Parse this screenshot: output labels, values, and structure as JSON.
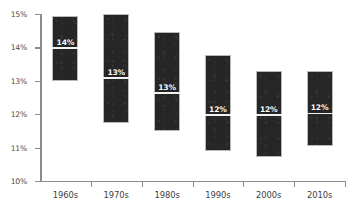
{
  "chart_data": {
    "type": "bar",
    "subtype": "floating-range-bar-with-median",
    "title": "",
    "xlabel": "",
    "ylabel": "",
    "categories": [
      "1960s",
      "1970s",
      "1980s",
      "1990s",
      "2000s",
      "2010s"
    ],
    "ylim": [
      10,
      15
    ],
    "ytick_labels": [
      "10%",
      "11%",
      "12%",
      "13%",
      "14%",
      "15%"
    ],
    "ytick_values": [
      10,
      11,
      12,
      13,
      14,
      15
    ],
    "grid": false,
    "legend": null,
    "value_suffix": "%",
    "series": [
      {
        "name": "Range (low to high)",
        "low": [
          13.0,
          11.75,
          11.5,
          10.9,
          10.72,
          11.05
        ],
        "high": [
          14.93,
          15.0,
          14.45,
          13.77,
          13.3,
          13.3
        ]
      },
      {
        "name": "Median",
        "values": [
          14.0,
          13.1,
          12.65,
          12.0,
          12.0,
          12.05
        ]
      }
    ],
    "bars": [
      {
        "category": "1960s",
        "low": 13.0,
        "high": 14.93,
        "median": 14.0,
        "label": "14%"
      },
      {
        "category": "1970s",
        "low": 11.75,
        "high": 15.0,
        "median": 13.1,
        "label": "13%"
      },
      {
        "category": "1980s",
        "low": 11.5,
        "high": 14.45,
        "median": 12.65,
        "label": "13%"
      },
      {
        "category": "1990s",
        "low": 10.9,
        "high": 13.77,
        "median": 12.0,
        "label": "12%"
      },
      {
        "category": "2000s",
        "low": 10.72,
        "high": 13.3,
        "median": 12.0,
        "label": "12%"
      },
      {
        "category": "2010s",
        "low": 11.05,
        "high": 13.3,
        "median": 12.05,
        "label": "12%"
      }
    ],
    "colors": {
      "bar_fill": "#262626",
      "bar_border": "#b9b9b9",
      "median_line": "#f2f2f2",
      "median_label_text": "#ffffff",
      "axis": "#8c8c8c",
      "tick_label": "#4a4a4a",
      "category_label": "#3d3d3d",
      "background": "#ffffff"
    }
  }
}
